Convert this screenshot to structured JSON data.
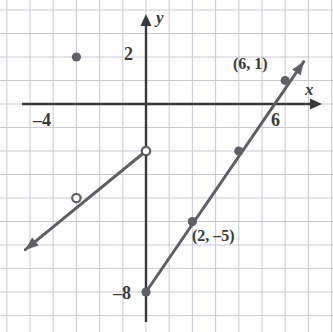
{
  "figure": {
    "type": "coordinate-plane-graph",
    "background_color": "#fefefe",
    "grid_color": "#c9c9d4",
    "axis_color": "#3a3a3a",
    "curve_color": "#5f5f68",
    "axis_labels": {
      "x": "x",
      "y": "y"
    },
    "tick_labels": [
      {
        "text": "2",
        "axis": "y",
        "value": 2
      },
      {
        "text": "–8",
        "axis": "y",
        "value": -8
      },
      {
        "text": "–4",
        "axis": "x",
        "value": -4
      },
      {
        "text": "6",
        "axis": "x",
        "value": 6
      }
    ],
    "annotations": [
      {
        "text": "(6, 1)",
        "point": [
          6,
          1
        ]
      },
      {
        "text": "(2, –5)",
        "point": [
          2,
          -5
        ]
      }
    ]
  },
  "chart_data": {
    "type": "line",
    "title": "",
    "xlabel": "x",
    "ylabel": "y",
    "xlim": [
      -5.5,
      7.5
    ],
    "ylim": [
      -9.5,
      3.0
    ],
    "grid": true,
    "legend": null,
    "series": [
      {
        "name": "left-branch",
        "kind": "ray",
        "from": [
          -5.2,
          -6.2
        ],
        "to": [
          0,
          -2
        ],
        "arrow_at": "from",
        "endpoint_style": "open-circle-at-to",
        "marked_points": [
          {
            "x": -3,
            "y": -4,
            "style": "open-circle"
          },
          {
            "x": 0,
            "y": -2,
            "style": "open-circle"
          }
        ]
      },
      {
        "name": "right-branch",
        "kind": "ray",
        "from": [
          0,
          -8
        ],
        "to": [
          6.8,
          1.8
        ],
        "arrow_at": "to",
        "endpoint_style": "filled-dot-at-from",
        "marked_points": [
          {
            "x": 0,
            "y": -8,
            "style": "filled-dot"
          },
          {
            "x": 2,
            "y": -5,
            "style": "filled-dot"
          },
          {
            "x": 4,
            "y": -2,
            "style": "filled-dot"
          },
          {
            "x": 6,
            "y": 1,
            "style": "filled-dot"
          }
        ]
      }
    ],
    "isolated_points": [
      {
        "x": -3,
        "y": 2,
        "style": "filled-dot"
      }
    ],
    "xticks": [
      -4,
      6
    ],
    "yticks": [
      2,
      -8
    ]
  }
}
